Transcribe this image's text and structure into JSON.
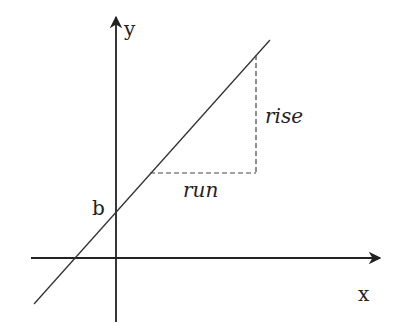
{
  "diagram": {
    "type": "slope-intercept",
    "labels": {
      "y_axis": "y",
      "x_axis": "x",
      "intercept": "b",
      "rise": "rise",
      "run": "run"
    },
    "colors": {
      "ink": "#222222",
      "dashed": "#444444",
      "background": "#ffffff"
    }
  }
}
